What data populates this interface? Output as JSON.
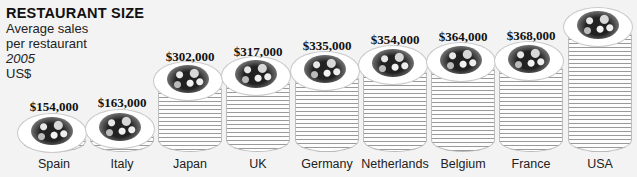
{
  "header": {
    "title": "RESTAURANT SIZE",
    "subtitle_line1": "Average sales",
    "subtitle_line2": "per restaurant",
    "year": "2005",
    "unit": "US$"
  },
  "bars": [
    {
      "country": "Spain",
      "value_label": "$154,000"
    },
    {
      "country": "Italy",
      "value_label": "$163,000"
    },
    {
      "country": "Japan",
      "value_label": "$302,000"
    },
    {
      "country": "UK",
      "value_label": "$317,000"
    },
    {
      "country": "Germany",
      "value_label": "$335,000"
    },
    {
      "country": "Netherlands",
      "value_label": "$354,000"
    },
    {
      "country": "Belgium",
      "value_label": "$364,000"
    },
    {
      "country": "France",
      "value_label": "$368,000"
    },
    {
      "country": "USA",
      "value_label": ""
    }
  ],
  "chart_data": {
    "type": "bar",
    "title": "RESTAURANT SIZE",
    "subtitle": "Average sales per restaurant, 2005, US$",
    "xlabel": "",
    "ylabel": "US$",
    "categories": [
      "Spain",
      "Italy",
      "Japan",
      "UK",
      "Germany",
      "Netherlands",
      "Belgium",
      "France",
      "USA"
    ],
    "values": [
      154000,
      163000,
      302000,
      317000,
      335000,
      354000,
      364000,
      368000,
      null
    ],
    "annotations": "Bars drawn as stacks of plates with food on top; USA value label cropped off image",
    "grid": false,
    "legend": "none"
  }
}
